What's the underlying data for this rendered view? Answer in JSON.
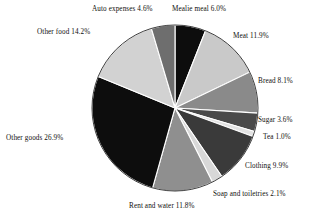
{
  "chart_data": {
    "type": "pie",
    "title": "",
    "subtitle": "",
    "xlabel": "",
    "ylabel": "",
    "grid": false,
    "legend_position": "none",
    "labels_position": "outside-radial",
    "start_angle_deg": 0,
    "direction": "clockwise",
    "total_percent": 100.1,
    "categories": [
      "Mealie meal",
      "Meat",
      "Bread",
      "Sugar",
      "Tea",
      "Clothing",
      "Soap and toiletries",
      "Rent and water",
      "Other goods",
      "Other food",
      "Auto expenses"
    ],
    "values": [
      6.0,
      11.9,
      8.1,
      3.6,
      1.0,
      9.9,
      2.1,
      11.8,
      26.9,
      14.2,
      4.6
    ],
    "slice_colors": [
      "#0d0d0d",
      "#c9c9c9",
      "#8a8a8a",
      "#4a4a4a",
      "#e2e2e2",
      "#3a3a3a",
      "#d8d8d8",
      "#8f8f8f",
      "#0d0d0d",
      "#d2d2d2",
      "#6e6e6e"
    ],
    "slice_label_text": [
      "Mealie meal 6.0%",
      "Meat 11.9%",
      "Bread 8.1%",
      "Sugar 3.6%",
      "Tea 1.0%",
      "Clothing 9.9%",
      "Soap and toiletries 2.1%",
      "Rent and water 11.8%",
      "Other goods 26.9%",
      "Other food 14.2%",
      "Auto expenses 4.6%"
    ],
    "stroke_color": "#ffffff",
    "outline_color": "#2a2a2a",
    "background": "#ffffff"
  },
  "labels": {
    "mealie_meal": "Mealie meal 6.0%",
    "meat": "Meat 11.9%",
    "bread": "Bread 8.1%",
    "sugar": "Sugar 3.6%",
    "tea": "Tea 1.0%",
    "clothing": "Clothing 9.9%",
    "soap": "Soap and toiletries 2.1%",
    "rent_water": "Rent and water 11.8%",
    "other_goods": "Other goods 26.9%",
    "other_food": "Other food 14.2%",
    "auto_expenses": "Auto expenses 4.6%"
  }
}
